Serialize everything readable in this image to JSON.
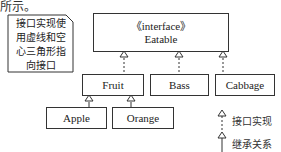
{
  "header_fragment": "所示。",
  "note": {
    "lines": [
      "接口实现使",
      "用虚线和空",
      "心三角形指",
      "向接口"
    ]
  },
  "interface": {
    "stereotype": "《interface》",
    "name": "Eatable"
  },
  "classes": {
    "fruit": "Fruit",
    "bass": "Bass",
    "cabbage": "Cabbage",
    "apple": "Apple",
    "orange": "Orange"
  },
  "legend": {
    "implementation": "接口实现",
    "inheritance": "继承关系"
  },
  "colors": {
    "line": "#333333",
    "background": "#ffffff"
  }
}
